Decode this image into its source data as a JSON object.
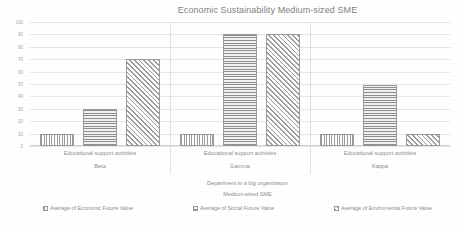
{
  "chart_data": {
    "type": "bar",
    "title": "Economic Sustainability Medium-sized SME",
    "xlabel": "Department in a big organization",
    "sublabel": "Medium-sized SME",
    "ylabel": "",
    "ylim": [
      0,
      100
    ],
    "ytick_step": 10,
    "grid": true,
    "legend_position": "bottom",
    "categories": [
      "Beta",
      "Gamma",
      "Kappa"
    ],
    "category_activity": [
      "Educational support activities",
      "Educational support activities",
      "Educational support activities"
    ],
    "yticks": [
      "100",
      "90",
      "80",
      "70",
      "60",
      "50",
      "40",
      "30",
      "20",
      "10",
      "0"
    ],
    "series": [
      {
        "name": "Average of Economic Future Value",
        "pattern": "vertical-lines",
        "values": [
          10,
          10,
          10
        ]
      },
      {
        "name": "Average of Social Future Value",
        "pattern": "horizontal-lines",
        "values": [
          30,
          90,
          49
        ]
      },
      {
        "name": "Average of Enviromental Future Value",
        "pattern": "diagonal-hatch",
        "values": [
          70,
          90,
          10
        ]
      }
    ]
  },
  "colors": {
    "text": "#8c8c8c",
    "gridline": "#e6e6e6",
    "bar_border": "#9a9a9a",
    "background": "#ffffff"
  }
}
